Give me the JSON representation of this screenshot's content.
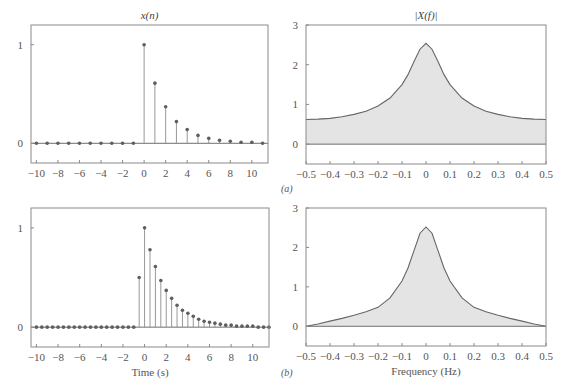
{
  "colors": {
    "frame": "#8a8a8a",
    "stem": "#8c8c8c",
    "marker": "#5e5e5e",
    "curve": "#666666",
    "fill": "#e4e4e4",
    "baseline": "#6e6e6e"
  },
  "panel_labels": {
    "a": "(a)",
    "b": "(b)"
  },
  "chart_data": [
    {
      "id": "top-left",
      "type": "stem",
      "title": "x(n)",
      "xlabel": "",
      "ylabel": "",
      "xlim": [
        -10.5,
        11.5
      ],
      "ylim": [
        -0.2,
        1.2
      ],
      "xticks": [
        -10,
        -8,
        -6,
        -4,
        -2,
        0,
        2,
        4,
        6,
        8,
        10
      ],
      "xtick_labels": [
        "−10",
        "−8",
        "−6",
        "−4",
        "−2",
        "0",
        "2",
        "4",
        "6",
        "8",
        "10"
      ],
      "yticks": [
        0,
        1
      ],
      "ytick_labels": [
        "0",
        "1"
      ],
      "x": [
        -10,
        -9,
        -8,
        -7,
        -6,
        -5,
        -4,
        -3,
        -2,
        -1,
        0,
        1,
        2,
        3,
        4,
        5,
        6,
        7,
        8,
        9,
        10,
        11
      ],
      "values": [
        0,
        0,
        0,
        0,
        0,
        0,
        0,
        0,
        0,
        0,
        1.0,
        0.61,
        0.37,
        0.22,
        0.14,
        0.08,
        0.05,
        0.03,
        0.02,
        0.01,
        0.01,
        0.0
      ]
    },
    {
      "id": "top-right",
      "type": "area",
      "title": "|X(f)|",
      "xlabel": "",
      "ylabel": "",
      "xlim": [
        -0.5,
        0.5
      ],
      "ylim": [
        -0.5,
        3
      ],
      "xticks": [
        -0.5,
        -0.4,
        -0.3,
        -0.2,
        -0.1,
        0,
        0.1,
        0.2,
        0.3,
        0.4,
        0.5
      ],
      "xtick_labels": [
        "−0.5",
        "−0.4",
        "−0.3",
        "−0.2",
        "−0.1",
        "0",
        "0.1",
        "0.2",
        "0.3",
        "0.4",
        "0.5"
      ],
      "yticks": [
        0,
        1,
        2,
        3
      ],
      "ytick_labels": [
        "0",
        "1",
        "2",
        "3"
      ],
      "x": [
        -0.5,
        -0.45,
        -0.4,
        -0.35,
        -0.3,
        -0.25,
        -0.2,
        -0.15,
        -0.1,
        -0.075,
        -0.05,
        -0.025,
        0,
        0.025,
        0.05,
        0.075,
        0.1,
        0.15,
        0.2,
        0.25,
        0.3,
        0.35,
        0.4,
        0.45,
        0.5
      ],
      "values": [
        0.62,
        0.63,
        0.65,
        0.69,
        0.75,
        0.83,
        0.96,
        1.16,
        1.5,
        1.75,
        2.08,
        2.39,
        2.54,
        2.39,
        2.08,
        1.75,
        1.5,
        1.16,
        0.96,
        0.83,
        0.75,
        0.69,
        0.65,
        0.63,
        0.62
      ]
    },
    {
      "id": "bottom-left",
      "type": "stem",
      "title": "",
      "xlabel": "Time (s)",
      "ylabel": "",
      "xlim": [
        -10.5,
        11.5
      ],
      "ylim": [
        -0.2,
        1.2
      ],
      "xticks": [
        -10,
        -8,
        -6,
        -4,
        -2,
        0,
        2,
        4,
        6,
        8,
        10
      ],
      "xtick_labels": [
        "−10",
        "−8",
        "−6",
        "−4",
        "−2",
        "0",
        "2",
        "4",
        "6",
        "8",
        "10"
      ],
      "yticks": [
        0,
        1
      ],
      "ytick_labels": [
        "0",
        "1"
      ],
      "x": [
        -10,
        -9.5,
        -9,
        -8.5,
        -8,
        -7.5,
        -7,
        -6.5,
        -6,
        -5.5,
        -5,
        -4.5,
        -4,
        -3.5,
        -3,
        -2.5,
        -2,
        -1.5,
        -1,
        -0.5,
        0,
        0.5,
        1,
        1.5,
        2,
        2.5,
        3,
        3.5,
        4,
        4.5,
        5,
        5.5,
        6,
        6.5,
        7,
        7.5,
        8,
        8.5,
        9,
        9.5,
        10,
        10.5,
        11,
        11.5
      ],
      "values": [
        0,
        0,
        0,
        0,
        0,
        0,
        0,
        0,
        0,
        0,
        0,
        0,
        0,
        0,
        0,
        0,
        0,
        0,
        0,
        0.5,
        1.0,
        0.78,
        0.61,
        0.47,
        0.37,
        0.29,
        0.22,
        0.17,
        0.14,
        0.11,
        0.08,
        0.06,
        0.05,
        0.04,
        0.03,
        0.02,
        0.02,
        0.01,
        0.01,
        0.01,
        0.01,
        0.0,
        0.0,
        0.0
      ]
    },
    {
      "id": "bottom-right",
      "type": "area",
      "title": "",
      "xlabel": "Frequency (Hz)",
      "ylabel": "",
      "xlim": [
        -0.5,
        0.5
      ],
      "ylim": [
        -0.5,
        3
      ],
      "xticks": [
        -0.5,
        -0.4,
        -0.3,
        -0.2,
        -0.1,
        0,
        0.1,
        0.2,
        0.3,
        0.4,
        0.5
      ],
      "xtick_labels": [
        "−0.5",
        "−0.4",
        "−0.3",
        "−0.2",
        "−0.1",
        "0",
        "0.1",
        "0.2",
        "0.3",
        "0.4",
        "0.5"
      ],
      "yticks": [
        0,
        1,
        2,
        3
      ],
      "ytick_labels": [
        "0",
        "1",
        "2",
        "3"
      ],
      "x": [
        -0.5,
        -0.45,
        -0.4,
        -0.35,
        -0.3,
        -0.25,
        -0.2,
        -0.15,
        -0.1,
        -0.075,
        -0.05,
        -0.025,
        0,
        0.025,
        0.05,
        0.075,
        0.1,
        0.15,
        0.2,
        0.25,
        0.3,
        0.35,
        0.4,
        0.45,
        0.5
      ],
      "values": [
        0.0,
        0.06,
        0.13,
        0.2,
        0.28,
        0.37,
        0.48,
        0.72,
        1.15,
        1.48,
        1.92,
        2.36,
        2.52,
        2.36,
        1.92,
        1.48,
        1.15,
        0.72,
        0.48,
        0.37,
        0.28,
        0.2,
        0.13,
        0.06,
        0.0
      ]
    }
  ]
}
